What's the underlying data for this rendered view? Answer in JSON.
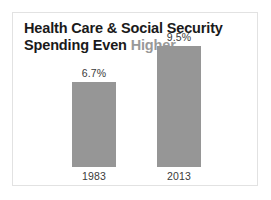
{
  "card": {
    "border_color": "#e2e2e2",
    "background": "#ffffff"
  },
  "title": {
    "lead": "Health Care & Social Security Spending Even ",
    "accent": "Higher",
    "accent_color": "#999999",
    "color": "#1a1a1a"
  },
  "chart_data": {
    "type": "bar",
    "title": "Health Care & Social Security Spending Even Higher",
    "categories": [
      "1983",
      "2013"
    ],
    "values": [
      6.7,
      9.5
    ],
    "value_labels": [
      "6.7%",
      "9.5%"
    ],
    "xlabel": "",
    "ylabel": "",
    "ylim": [
      0,
      11.5
    ],
    "unit": "%",
    "grid": false,
    "legend": false,
    "bar_color": "#969696",
    "label_color": "#3a3a3a"
  }
}
